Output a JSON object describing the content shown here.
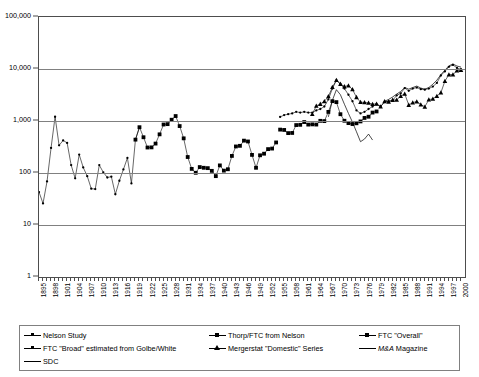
{
  "chart_data": {
    "type": "line",
    "title": "",
    "xlabel": "",
    "ylabel": "",
    "log_y": true,
    "ylim": [
      1,
      100000
    ],
    "xlim": [
      1895,
      2001
    ],
    "grid": "horizontal",
    "legend_position": "bottom",
    "y_ticks": [
      "1",
      "10",
      "100",
      "1,000",
      "10,000",
      "100,000"
    ],
    "y_tick_values": [
      1,
      10,
      100,
      1000,
      10000,
      100000
    ],
    "x_ticks": [
      "1895",
      "1898",
      "1901",
      "1904",
      "1907",
      "1910",
      "1913",
      "1916",
      "1919",
      "1922",
      "1925",
      "1928",
      "1931",
      "1934",
      "1937",
      "1940",
      "1943",
      "1946",
      "1949",
      "1952",
      "1955",
      "1958",
      "1961",
      "1964",
      "1967",
      "1970",
      "1973",
      "1976",
      "1979",
      "1982",
      "1985",
      "1988",
      "1991",
      "1994",
      "1997",
      "2000"
    ],
    "x_tick_step": 3,
    "series": [
      {
        "name": "Nelson Study",
        "marker": "dot",
        "x": [
          1895,
          1896,
          1897,
          1898,
          1899,
          1900,
          1901,
          1902,
          1903,
          1904,
          1905,
          1906,
          1907,
          1908,
          1909,
          1910,
          1911,
          1912,
          1913,
          1914,
          1915,
          1916,
          1917,
          1918,
          1919,
          1920
        ],
        "values": [
          43,
          26,
          69,
          303,
          1208,
          340,
          423,
          379,
          142,
          79,
          226,
          128,
          87,
          50,
          49,
          142,
          103,
          82,
          85,
          39,
          71,
          117,
          195,
          63,
          438,
          760
        ]
      },
      {
        "name": "Thorp/FTC from Nelson",
        "marker": "square",
        "x": [
          1919,
          1920,
          1921,
          1922,
          1923,
          1924,
          1925,
          1926,
          1927,
          1928,
          1929,
          1930,
          1931,
          1932,
          1933,
          1934,
          1935,
          1936,
          1937,
          1938,
          1939,
          1940,
          1941,
          1942,
          1943,
          1944,
          1945,
          1946,
          1947,
          1948,
          1949,
          1950,
          1951,
          1952,
          1953,
          1954
        ],
        "values": [
          438,
          760,
          487,
          309,
          311,
          368,
          554,
          856,
          870,
          1058,
          1245,
          799,
          464,
          203,
          120,
          101,
          130,
          126,
          124,
          110,
          87,
          140,
          111,
          118,
          213,
          324,
          333,
          419,
          404,
          223,
          126,
          219,
          235,
          288,
          295,
          387
        ]
      },
      {
        "name": "FTC \"Overall\"",
        "marker": "square",
        "x": [
          1955,
          1956,
          1957,
          1958,
          1959,
          1960,
          1961,
          1962,
          1963,
          1964,
          1965,
          1966,
          1967,
          1968,
          1969,
          1970,
          1971,
          1972,
          1973,
          1974,
          1975,
          1976,
          1977,
          1978,
          1979
        ],
        "values": [
          683,
          673,
          585,
          589,
          835,
          844,
          954,
          853,
          861,
          854,
          1008,
          995,
          1496,
          2407,
          2307,
          1351,
          1011,
          911,
          874,
          904,
          981,
          1145,
          1209,
          1452,
          1526
        ]
      },
      {
        "name": "FTC \"Broad\" estimated from Golbe/White",
        "marker": "dot",
        "x": [
          1955,
          1956,
          1957,
          1958,
          1959,
          1960,
          1961,
          1962,
          1963,
          1964,
          1965,
          1966,
          1967,
          1968,
          1969,
          1970,
          1971,
          1972,
          1973,
          1974,
          1975,
          1976,
          1977,
          1978,
          1979,
          1980,
          1981,
          1982,
          1983,
          1984,
          1985,
          1986,
          1987,
          1988,
          1989,
          1990,
          1991,
          1992,
          1993,
          1994,
          1995,
          1996,
          1997,
          1998,
          1999,
          2000
        ],
        "values": [
          1200,
          1300,
          1350,
          1400,
          1500,
          1450,
          1500,
          1450,
          1450,
          1600,
          1700,
          1900,
          2600,
          4200,
          6050,
          5150,
          4200,
          3200,
          2400,
          1600,
          1400,
          1500,
          1700,
          1900,
          2100,
          1900,
          2300,
          2400,
          2500,
          3100,
          3400,
          4300,
          3800,
          4200,
          4400,
          4100,
          4000,
          4200,
          4600,
          5400,
          7500,
          9000,
          11000,
          12000,
          10500,
          9800
        ]
      },
      {
        "name": "Mergerstat \"Domestic\" Series",
        "marker": "triangle",
        "x": [
          1963,
          1964,
          1965,
          1966,
          1967,
          1968,
          1969,
          1970,
          1971,
          1972,
          1973,
          1974,
          1975,
          1976,
          1977,
          1978,
          1979,
          1980,
          1981,
          1982,
          1983,
          1984,
          1985,
          1986,
          1987,
          1988,
          1989,
          1990,
          1991,
          1992,
          1993,
          1994,
          1995,
          1996,
          1997,
          1998,
          1999,
          2000
        ],
        "values": [
          1361,
          1950,
          2125,
          2377,
          2975,
          4462,
          6107,
          5152,
          4608,
          4801,
          4040,
          2861,
          2297,
          2276,
          2224,
          2106,
          2128,
          1889,
          2395,
          2346,
          2533,
          2543,
          3001,
          3336,
          2032,
          2258,
          2366,
          2074,
          1877,
          2574,
          2663,
          2997,
          3510,
          5848,
          7800,
          7809,
          9278,
          9566
        ]
      },
      {
        "name": "M&A Magazine",
        "marker": "none",
        "x": [
          1967,
          1968,
          1969,
          1970,
          1971,
          1972,
          1973,
          1974,
          1975,
          1976,
          1977,
          1978
        ],
        "values": [
          1200,
          2500,
          4000,
          3200,
          2100,
          1400,
          950,
          620,
          400,
          450,
          560,
          430
        ]
      },
      {
        "name": "SDC",
        "marker": "none",
        "x": [
          1981,
          1982,
          1983,
          1984,
          1985,
          1986,
          1987,
          1988,
          1989,
          1990,
          1991,
          1992,
          1993,
          1994,
          1995,
          1996,
          1997,
          1998,
          1999,
          2000
        ],
        "values": [
          2395,
          2600,
          2900,
          3300,
          3700,
          4400,
          4100,
          4400,
          4700,
          4300,
          4100,
          4400,
          5100,
          6100,
          7800,
          9500,
          11500,
          12500,
          11400,
          10900
        ]
      }
    ]
  },
  "legend": {
    "items": [
      {
        "label": "Nelson Study",
        "marker": "dot"
      },
      {
        "label": "Thorp/FTC from Nelson",
        "marker": "square"
      },
      {
        "label": "FTC \"Overall\"",
        "marker": "square"
      },
      {
        "label": "FTC \"Broad\" estimated from Golbe/White",
        "marker": "dot"
      },
      {
        "label": "Mergerstat \"Domestic\" Series",
        "marker": "triangle"
      },
      {
        "label": "M&A Magazine",
        "marker": "none"
      },
      {
        "label": "SDC",
        "marker": "none"
      }
    ]
  }
}
